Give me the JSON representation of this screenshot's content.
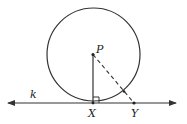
{
  "figure": {
    "labels": {
      "center": "P",
      "tangent_point": "X",
      "external_point": "Y",
      "line": "k"
    },
    "colors": {
      "stroke": "#333333",
      "background": "#ffffff"
    },
    "geometry": {
      "circle": {
        "cx": 93.5,
        "cy": 54.5,
        "r": 46.5
      },
      "line_y": 103,
      "line_x_start": 8,
      "line_x_end": 176,
      "P": {
        "x": 93,
        "y": 54.5
      },
      "X": {
        "x": 93,
        "y": 103
      },
      "Y": {
        "x": 134,
        "y": 103
      },
      "right_angle_size": 6
    }
  }
}
